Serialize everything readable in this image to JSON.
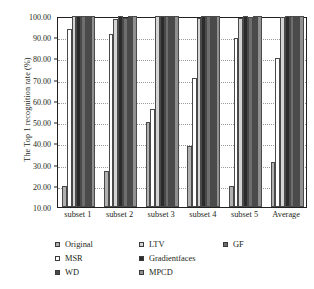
{
  "chart_data": {
    "type": "bar",
    "title": "",
    "subtitle": "",
    "xlabel": "",
    "ylabel": "The Top 1 recognition rate (%)",
    "ylim": [
      10.0,
      100.0
    ],
    "ytick_step": 10.0,
    "ytick_labels": [
      "100.00",
      "90.00",
      "80.00",
      "70.00",
      "60.00",
      "50.00",
      "40.00",
      "30.00",
      "20.00",
      "10.00"
    ],
    "ytick_values": [
      100.0,
      90.0,
      80.0,
      70.0,
      60.0,
      50.0,
      40.0,
      30.0,
      20.0,
      10.0
    ],
    "grid": true,
    "grid_axis": "y",
    "legend_position": "bottom",
    "categories": [
      "subset 1",
      "subset 2",
      "subset 3",
      "subset 4",
      "subset 5",
      "Average"
    ],
    "series": [
      {
        "name": "Original",
        "color": "#b0b0b0",
        "values": [
          19.8,
          26.8,
          50.0,
          38.8,
          20.1,
          31.0
        ]
      },
      {
        "name": "MSR",
        "color": "#ffffff",
        "values": [
          93.9,
          91.4,
          56.3,
          71.0,
          89.5,
          80.0
        ]
      },
      {
        "name": "LTV",
        "color": "#d4d4d4",
        "values": [
          100.0,
          98.8,
          100.0,
          98.9,
          99.2,
          99.4
        ]
      },
      {
        "name": "Gradientfaces",
        "color": "#2b2b2b",
        "values": [
          100.0,
          100.0,
          100.0,
          100.0,
          100.0,
          100.0
        ]
      },
      {
        "name": "GF",
        "color": "#6e6e6e",
        "values": [
          100.0,
          99.3,
          100.0,
          100.0,
          99.6,
          99.8
        ]
      },
      {
        "name": "WD",
        "color": "#4a4a4a",
        "values": [
          100.0,
          100.0,
          100.0,
          100.0,
          100.0,
          100.0
        ]
      },
      {
        "name": "MPCD",
        "color": "#909090",
        "values": [
          100.0,
          100.0,
          100.0,
          100.0,
          100.0,
          100.0
        ]
      }
    ]
  },
  "legend": {
    "rows": [
      [
        {
          "label": "Original",
          "color": "#b0b0b0"
        },
        {
          "label": "LTV",
          "color": "#d4d4d4"
        },
        {
          "label": "GF",
          "color": "#6e6e6e"
        }
      ],
      [
        {
          "label": "MSR",
          "color": "#ffffff"
        },
        {
          "label": "Gradientfaces",
          "color": "#2b2b2b"
        }
      ],
      [
        {
          "label": "WD",
          "color": "#4a4a4a"
        },
        {
          "label": "MPCD",
          "color": "#909090"
        }
      ]
    ]
  }
}
